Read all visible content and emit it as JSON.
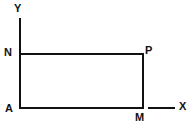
{
  "figure": {
    "kind": "geometry-diagram",
    "stroke_color": "#111111",
    "background_color": "#ffffff",
    "stroke_width": 2,
    "axes": {
      "x_axis": {
        "label": "X",
        "label_name": "x-axis-label",
        "segment": {
          "x1": 148,
          "y1": 108,
          "x2": 175,
          "y2": 108
        }
      },
      "y_axis": {
        "label": "Y",
        "label_name": "y-axis-label",
        "segment": {
          "x1": 20,
          "y1": 18,
          "x2": 20,
          "y2": 52
        }
      }
    },
    "rectangle": {
      "name": "rectangle-ANPM",
      "corners": {
        "left": 20,
        "top": 54,
        "right": 143,
        "bottom": 108
      },
      "width": 123,
      "height": 54
    },
    "vertices": [
      {
        "id": "N",
        "label": "N",
        "x": 20,
        "y": 54
      },
      {
        "id": "P",
        "label": "P",
        "x": 143,
        "y": 54
      },
      {
        "id": "A",
        "label": "A",
        "x": 20,
        "y": 108
      },
      {
        "id": "M",
        "label": "M",
        "x": 143,
        "y": 108
      }
    ]
  }
}
